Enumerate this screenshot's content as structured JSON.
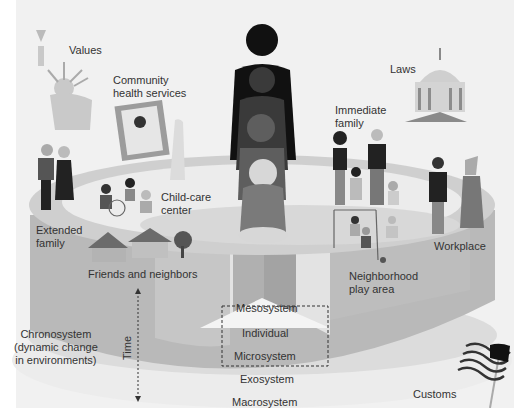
{
  "diagram": {
    "colors": {
      "background": "#f1f1f1",
      "cylinder_side": "#b9b9b9",
      "cylinder_side_dark": "#a9a9a9",
      "cylinder_top_ring": "#d2d2d2",
      "inner_ellipse": "#ebebeb",
      "exosystem_band": "#dcdcdc",
      "macrosystem_band": "#efefef",
      "figure_dark": "#111111"
    },
    "labels": {
      "values": "Values",
      "community_health": "Community\nhealth services",
      "laws": "Laws",
      "immediate_family": "Immediate\nfamily",
      "child_care": "Child-care\ncenter",
      "extended_family": "Extended\nfamily",
      "friends_neighbors": "Friends and neighbors",
      "neighborhood_play": "Neighborhood\nplay area",
      "workplace": "Workplace",
      "chronosystem": "Chronosystem\n(dynamic change\nin environments)",
      "time": "Time",
      "mesosystem": "Mesosystem",
      "individual": "Individual",
      "microsystem": "Microsystem",
      "exosystem": "Exosystem",
      "macrosystem": "Macrosystem",
      "customs": "Customs"
    },
    "icons": [
      "statue-of-liberty-icon",
      "doctor-portrait-icon",
      "capitol-building-icon",
      "family-figures-icon",
      "houses-icon",
      "swing-set-icon",
      "business-people-icon",
      "american-flag-icon",
      "growing-child-silhouette-icon"
    ]
  }
}
